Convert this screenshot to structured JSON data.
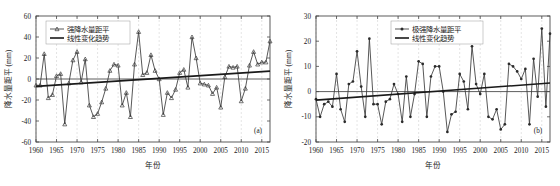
{
  "figure": {
    "width": 560,
    "height": 186,
    "background": "#ffffff",
    "line_color": "#3a3a3a",
    "trend_color": "#1a1a1a",
    "grid_color": "#c8c8c8"
  },
  "chart_data": [
    {
      "type": "line",
      "panel_tag": "(a)",
      "title": "",
      "xlabel": "年份",
      "ylabel": "降水量距平 (mm)",
      "xlim": [
        1960,
        2017
      ],
      "ylim": [
        -60,
        60
      ],
      "xticks": [
        1960,
        1965,
        1970,
        1975,
        1980,
        1985,
        1990,
        1995,
        2000,
        2005,
        2010,
        2015
      ],
      "yticks": [
        -60,
        -40,
        -20,
        0,
        20,
        40,
        60
      ],
      "grid": "vertical",
      "legend_position": "top-left",
      "legend": [
        "强降水量距平",
        "线性变化趋势"
      ],
      "marker": "open-triangle",
      "x": [
        1960,
        1961,
        1962,
        1963,
        1964,
        1965,
        1966,
        1967,
        1968,
        1969,
        1970,
        1971,
        1972,
        1973,
        1974,
        1975,
        1976,
        1977,
        1978,
        1979,
        1980,
        1981,
        1982,
        1983,
        1984,
        1985,
        1986,
        1987,
        1988,
        1989,
        1990,
        1991,
        1992,
        1993,
        1994,
        1995,
        1996,
        1997,
        1998,
        1999,
        2000,
        2001,
        2002,
        2003,
        2004,
        2005,
        2006,
        2007,
        2008,
        2009,
        2010,
        2011,
        2012,
        2013,
        2014,
        2015,
        2016,
        2017
      ],
      "values": [
        -6,
        -6,
        24,
        -18,
        -15,
        3,
        5,
        -43,
        -4,
        18,
        26,
        -3,
        19,
        -25,
        -36,
        -33,
        -22,
        -9,
        8,
        14,
        13,
        -25,
        -13,
        -36,
        14,
        45,
        4,
        6,
        23,
        8,
        0,
        -34,
        -13,
        -18,
        -10,
        6,
        9,
        -8,
        40,
        20,
        -4,
        -5,
        -6,
        -14,
        -8,
        -27,
        2,
        12,
        11,
        12,
        -21,
        -9,
        13,
        26,
        14,
        16,
        16,
        36
      ],
      "series": [
        {
          "name": "强降水量距平",
          "marker": "open-triangle",
          "values": [
            -6,
            -6,
            24,
            -18,
            -15,
            3,
            5,
            -43,
            -4,
            18,
            26,
            -3,
            19,
            -25,
            -36,
            -33,
            -22,
            -9,
            8,
            14,
            13,
            -25,
            -13,
            -36,
            14,
            45,
            4,
            6,
            23,
            8,
            0,
            -34,
            -13,
            -18,
            -10,
            6,
            9,
            -8,
            40,
            20,
            -4,
            -5,
            -6,
            -14,
            -8,
            -27,
            2,
            12,
            11,
            12,
            -21,
            -9,
            13,
            26,
            14,
            16,
            16,
            36
          ]
        },
        {
          "name": "线性变化趋势",
          "marker": "none",
          "trend": true,
          "y_start": -7.0,
          "y_end": 7.5
        }
      ]
    },
    {
      "type": "line",
      "panel_tag": "(b)",
      "title": "",
      "xlabel": "年份",
      "ylabel": "降水量距平 (mm)",
      "xlim": [
        1960,
        2017
      ],
      "ylim": [
        -20,
        30
      ],
      "xticks": [
        1960,
        1965,
        1970,
        1975,
        1980,
        1985,
        1990,
        1995,
        2000,
        2005,
        2010,
        2015
      ],
      "yticks": [
        -20,
        -10,
        0,
        10,
        20,
        30
      ],
      "grid": "vertical",
      "legend_position": "top-center",
      "legend": [
        "极强降水量距平",
        "线性变化趋势"
      ],
      "marker": "filled-dot",
      "x": [
        1960,
        1961,
        1962,
        1963,
        1964,
        1965,
        1966,
        1967,
        1968,
        1969,
        1970,
        1971,
        1972,
        1973,
        1974,
        1975,
        1976,
        1977,
        1978,
        1979,
        1980,
        1981,
        1982,
        1983,
        1984,
        1985,
        1986,
        1987,
        1988,
        1989,
        1990,
        1991,
        1992,
        1993,
        1994,
        1995,
        1996,
        1997,
        1998,
        1999,
        2000,
        2001,
        2002,
        2003,
        2004,
        2005,
        2006,
        2007,
        2008,
        2009,
        2010,
        2011,
        2012,
        2013,
        2014,
        2015,
        2016,
        2017
      ],
      "values": [
        -3,
        -10,
        -5,
        -4,
        -6,
        7,
        -7,
        -12,
        3,
        4,
        16,
        2,
        -10,
        21,
        -5,
        -5,
        -13,
        -4,
        -3,
        3,
        -1,
        -12,
        6,
        -10,
        -1,
        12,
        11,
        -10,
        6,
        10,
        10,
        0,
        -16,
        -9,
        -8,
        7,
        4,
        -7,
        18,
        3,
        -1,
        7,
        -10,
        -11,
        -7,
        -15,
        -13,
        11,
        10,
        8,
        5,
        9,
        -13,
        13,
        -2,
        25,
        -6,
        23
      ],
      "series": [
        {
          "name": "极强降水量距平",
          "marker": "filled-dot",
          "values": [
            -3,
            -10,
            -5,
            -4,
            -6,
            7,
            -7,
            -12,
            3,
            4,
            16,
            2,
            -10,
            21,
            -5,
            -5,
            -13,
            -4,
            -3,
            3,
            -1,
            -12,
            6,
            -10,
            -1,
            12,
            11,
            -10,
            6,
            10,
            10,
            0,
            -16,
            -9,
            -8,
            7,
            4,
            -7,
            18,
            3,
            -1,
            7,
            -10,
            -11,
            -7,
            -15,
            -13,
            11,
            10,
            8,
            5,
            9,
            -13,
            13,
            -2,
            25,
            -6,
            23
          ]
        },
        {
          "name": "线性变化趋势",
          "marker": "none",
          "trend": true,
          "y_start": -3.4,
          "y_end": 3.4
        }
      ]
    }
  ]
}
